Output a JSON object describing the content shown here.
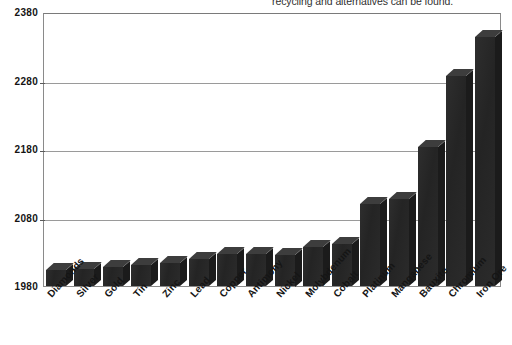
{
  "caption": {
    "text": "recycling and alternatives can be found."
  },
  "chart_data": {
    "type": "bar",
    "title": "",
    "subtitle": "",
    "xlabel": "",
    "ylabel": "",
    "categories": [
      "Diamonds",
      "Silver",
      "Gold",
      "Tin",
      "Zinc",
      "Lead",
      "Copper",
      "Antimony",
      "Nickel",
      "Molybdenum",
      "Cobalt",
      "Platinum",
      "Manganese",
      "Bauxite",
      "Chromium",
      "Iron Ore"
    ],
    "values": [
      2003,
      2005,
      2008,
      2010,
      2013,
      2020,
      2027,
      2027,
      2026,
      2037,
      2041,
      2100,
      2107,
      2183,
      2287,
      2344
    ],
    "ylim": [
      1980,
      2380
    ],
    "yticks": [
      1980,
      2080,
      2180,
      2280,
      2380
    ],
    "ytick_labels": [
      "1980",
      "2080",
      "2180",
      "2280",
      "2380"
    ],
    "grid": true,
    "legend": false,
    "legend_position": "none",
    "series_name": "Year of exhaustion",
    "bar_style": "3d",
    "bar_color": "#272727",
    "bar_top_color": "#3d3d3d",
    "bar_side_color": "#1b1b1b",
    "grid_color": "#9a9a9a",
    "frame_color": "#8a8a8a",
    "background_color": "#ffffff"
  }
}
